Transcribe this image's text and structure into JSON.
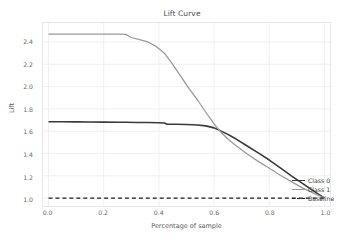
{
  "chart_data": {
    "type": "line",
    "title": "Lift Curve",
    "xlabel": "Percentage of sample",
    "ylabel": "Lift",
    "xlim": [
      -0.02,
      1.02
    ],
    "ylim": [
      0.93,
      2.57
    ],
    "grid": true,
    "legend_position": "lower right",
    "xticks": [
      "0.0",
      "0.2",
      "0.4",
      "0.6",
      "0.8",
      "1.0"
    ],
    "xtick_values": [
      0.0,
      0.2,
      0.4,
      0.6,
      0.8,
      1.0
    ],
    "yticks": [
      "1.0",
      "1.2",
      "1.4",
      "1.6",
      "1.8",
      "2.0",
      "2.2",
      "2.4"
    ],
    "ytick_values": [
      1.0,
      1.2,
      1.4,
      1.6,
      1.8,
      2.0,
      2.2,
      2.4
    ],
    "series": [
      {
        "name": "Class 0",
        "color": "#3a3a3a",
        "width": 1.6,
        "dash": "",
        "x": [
          0.0,
          0.05,
          0.1,
          0.15,
          0.2,
          0.25,
          0.28,
          0.32,
          0.36,
          0.4,
          0.42,
          0.43,
          0.46,
          0.5,
          0.54,
          0.57,
          0.6,
          0.62,
          0.65,
          0.68,
          0.72,
          0.76,
          0.8,
          0.84,
          0.88,
          0.92,
          0.96,
          1.0
        ],
        "y": [
          1.685,
          1.685,
          1.684,
          1.683,
          1.682,
          1.681,
          1.68,
          1.679,
          1.678,
          1.676,
          1.674,
          1.663,
          1.662,
          1.66,
          1.656,
          1.648,
          1.63,
          1.608,
          1.572,
          1.53,
          1.468,
          1.406,
          1.342,
          1.272,
          1.2,
          1.132,
          1.066,
          1.0
        ]
      },
      {
        "name": "Class 1",
        "color": "#9a9a9a",
        "width": 1.3,
        "dash": "",
        "x": [
          0.0,
          0.05,
          0.1,
          0.15,
          0.2,
          0.25,
          0.28,
          0.3,
          0.33,
          0.36,
          0.39,
          0.42,
          0.45,
          0.48,
          0.51,
          0.54,
          0.57,
          0.6,
          0.62,
          0.65,
          0.68,
          0.72,
          0.76,
          0.8,
          0.84,
          0.88,
          0.92,
          0.96,
          1.0
        ],
        "y": [
          2.47,
          2.47,
          2.47,
          2.47,
          2.47,
          2.47,
          2.468,
          2.44,
          2.42,
          2.4,
          2.36,
          2.3,
          2.2,
          2.09,
          1.98,
          1.88,
          1.77,
          1.665,
          1.605,
          1.53,
          1.47,
          1.396,
          1.33,
          1.268,
          1.205,
          1.148,
          1.092,
          1.045,
          1.0
        ]
      },
      {
        "name": "Baseline",
        "color": "#1a1a1a",
        "width": 1.2,
        "dash": "4,3",
        "x": [
          0.0,
          1.0
        ],
        "y": [
          1.0,
          1.0
        ]
      }
    ]
  },
  "legend": {
    "items": [
      {
        "label": "Class 0"
      },
      {
        "label": "Class 1"
      },
      {
        "label": "Baseline"
      }
    ]
  },
  "colors": {
    "background": "#ffffff",
    "grid": "#f0f0f2",
    "frame": "#e8e8ea",
    "class0": "#3a3a3a",
    "class1": "#9a9a9a",
    "baseline": "#1a1a1a"
  }
}
